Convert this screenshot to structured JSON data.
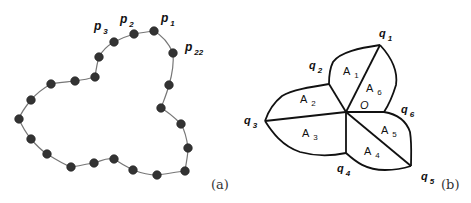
{
  "figure_a": {
    "caption": "(a)",
    "labels": [
      {
        "base": "p",
        "sub": "3",
        "x": 94,
        "y": 30
      },
      {
        "base": "p",
        "sub": "2",
        "x": 120,
        "y": 23
      },
      {
        "base": "p",
        "sub": "1",
        "x": 161,
        "y": 22
      },
      {
        "base": "p",
        "sub": "22",
        "x": 185,
        "y": 51
      }
    ],
    "points": [
      [
        154,
        31
      ],
      [
        134,
        34
      ],
      [
        114,
        42
      ],
      [
        99,
        57
      ],
      [
        95,
        77
      ],
      [
        75,
        81
      ],
      [
        51,
        84
      ],
      [
        31,
        100
      ],
      [
        19,
        119
      ],
      [
        31,
        139
      ],
      [
        47,
        154
      ],
      [
        71,
        167
      ],
      [
        94,
        163
      ],
      [
        114,
        159
      ],
      [
        133,
        170
      ],
      [
        157,
        175
      ],
      [
        185,
        171
      ],
      [
        188,
        148
      ],
      [
        181,
        124
      ],
      [
        161,
        108
      ],
      [
        169,
        85
      ],
      [
        173,
        53
      ]
    ]
  },
  "figure_b": {
    "caption": "(b)",
    "center": {
      "label": "O",
      "x": 346,
      "y": 112
    },
    "vertices": {
      "q1": [
        380,
        45
      ],
      "q2": [
        329,
        84
      ],
      "q3": [
        265,
        121
      ],
      "q4": [
        346,
        153
      ],
      "q5": [
        411,
        166
      ],
      "q6": [
        384,
        112
      ]
    },
    "vertex_labels": [
      {
        "base": "q",
        "sub": "1",
        "x": 379,
        "y": 37
      },
      {
        "base": "q",
        "sub": "2",
        "x": 309,
        "y": 69
      },
      {
        "base": "q",
        "sub": "3",
        "x": 244,
        "y": 124
      },
      {
        "base": "q",
        "sub": "4",
        "x": 337,
        "y": 172
      },
      {
        "base": "q",
        "sub": "5",
        "x": 421,
        "y": 180
      },
      {
        "base": "q",
        "sub": "6",
        "x": 401,
        "y": 113
      }
    ],
    "region_labels": [
      {
        "base": "A",
        "sub": "1",
        "x": 343,
        "y": 75
      },
      {
        "base": "A",
        "sub": "2",
        "x": 300,
        "y": 103
      },
      {
        "base": "A",
        "sub": "3",
        "x": 302,
        "y": 137
      },
      {
        "base": "A",
        "sub": "4",
        "x": 364,
        "y": 155
      },
      {
        "base": "A",
        "sub": "5",
        "x": 381,
        "y": 134
      },
      {
        "base": "A",
        "sub": "6",
        "x": 366,
        "y": 92
      }
    ]
  }
}
